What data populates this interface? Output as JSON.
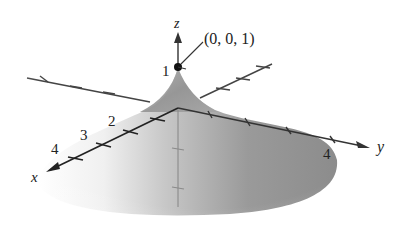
{
  "figure": {
    "type": "3d-surface-plot",
    "axes": {
      "x": {
        "label": "x",
        "tick_labels": [
          "2",
          "3",
          "4"
        ]
      },
      "y": {
        "label": "y",
        "tick_labels": [
          "4"
        ]
      },
      "z": {
        "label": "z",
        "tick_labels": [
          "1"
        ]
      }
    },
    "annotation": {
      "point_label": "(0, 0, 1)"
    },
    "colors": {
      "surface_dark": "#8a8a8a",
      "surface_light": "#f4f4f4",
      "axis": "#333333",
      "point": "#111111"
    }
  }
}
